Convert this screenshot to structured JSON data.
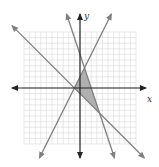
{
  "diagram": {
    "type": "coordinate-graph",
    "axis_labels": {
      "x": "x",
      "y": "y"
    },
    "grid_range": {
      "xmin": -10,
      "xmax": 10,
      "ymin": -10,
      "ymax": 10
    },
    "lines": [
      {
        "name": "line-a",
        "slope": 2,
        "intercept": 2
      },
      {
        "name": "line-b",
        "slope": -3,
        "intercept": 6
      },
      {
        "name": "line-c",
        "slope": -1,
        "intercept": -1
      }
    ],
    "shaded_region": {
      "vertices": [
        [
          -1,
          0
        ],
        [
          0.8,
          3.6
        ],
        [
          3.5,
          -4.5
        ]
      ],
      "fill": "#b0b0b0"
    },
    "colors": {
      "grid": "#d9d9d9",
      "axis": "#222222",
      "line": "#808080"
    }
  }
}
